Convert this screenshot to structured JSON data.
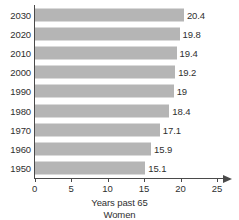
{
  "chart_data": {
    "type": "bar",
    "orientation": "horizontal",
    "title": "",
    "xlabel": "Years past 65",
    "sublabel": "Women",
    "ylabel": "",
    "categories": [
      "2030",
      "2020",
      "2010",
      "2000",
      "1990",
      "1980",
      "1970",
      "1960",
      "1950"
    ],
    "values": [
      20.4,
      19.8,
      19.4,
      19.2,
      19,
      18.4,
      17.1,
      15.9,
      15.1
    ],
    "value_labels": [
      "20.4",
      "19.8",
      "19.4",
      "19.2",
      "19",
      "18.4",
      "17.1",
      "15.9",
      "15.1"
    ],
    "xlim": [
      0,
      25
    ],
    "xticks": [
      0,
      5,
      10,
      15,
      20,
      25
    ],
    "xtick_labels": [
      "0",
      "5",
      "10",
      "15",
      "20",
      "25"
    ],
    "grid": false,
    "legend": false,
    "series": [
      {
        "name": "Women",
        "values": [
          20.4,
          19.8,
          19.4,
          19.2,
          19,
          18.4,
          17.1,
          15.9,
          15.1
        ]
      }
    ]
  },
  "style": {
    "bar_color": "#b5b5b5",
    "axis_color": "#4a4a4a",
    "text_color": "#2f2f2f",
    "background": "#ffffff"
  }
}
